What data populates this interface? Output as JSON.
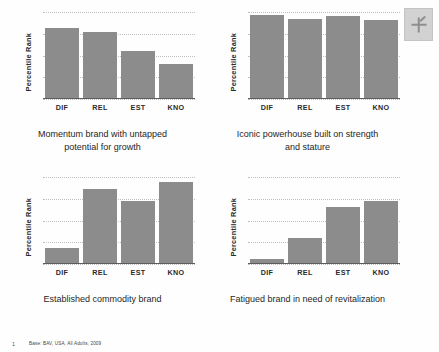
{
  "slide": {
    "corner_graphic_name": "placeholder-image-icon",
    "footnote_marker": "1",
    "footnote_text": "Base: BAV, USA, All Adults, 2009"
  },
  "axis": {
    "y_title": "Percentile Rank",
    "categories": [
      "DIF",
      "REL",
      "EST",
      "KNO"
    ]
  },
  "panels": [
    {
      "id": "momentum",
      "caption": "Momentum brand with untapped potential for growth",
      "values": [
        82,
        77,
        55,
        40
      ]
    },
    {
      "id": "iconic",
      "caption": "Iconic powerhouse  built on strength and stature",
      "values": [
        96,
        92,
        95,
        91
      ]
    },
    {
      "id": "commodity",
      "caption": "Established commodity brand",
      "values": [
        18,
        86,
        72,
        94
      ]
    },
    {
      "id": "fatigued",
      "caption": "Fatigued brand in need of revitalization",
      "values": [
        6,
        30,
        66,
        72
      ]
    }
  ],
  "chart_data": [
    {
      "type": "bar",
      "title": "Momentum brand with untapped potential for growth",
      "categories": [
        "DIF",
        "REL",
        "EST",
        "KNO"
      ],
      "values": [
        82,
        77,
        55,
        40
      ],
      "xlabel": "",
      "ylabel": "Percentile Rank",
      "ylim": [
        0,
        100
      ],
      "grid": true,
      "legend": "none",
      "bar_color": "#8c8c8c"
    },
    {
      "type": "bar",
      "title": "Iconic powerhouse  built on strength and stature",
      "categories": [
        "DIF",
        "REL",
        "EST",
        "KNO"
      ],
      "values": [
        96,
        92,
        95,
        91
      ],
      "xlabel": "",
      "ylabel": "Percentile Rank",
      "ylim": [
        0,
        100
      ],
      "grid": true,
      "legend": "none",
      "bar_color": "#8c8c8c"
    },
    {
      "type": "bar",
      "title": "Established commodity brand",
      "categories": [
        "DIF",
        "REL",
        "EST",
        "KNO"
      ],
      "values": [
        18,
        86,
        72,
        94
      ],
      "xlabel": "",
      "ylabel": "Percentile Rank",
      "ylim": [
        0,
        100
      ],
      "grid": true,
      "legend": "none",
      "bar_color": "#8c8c8c"
    },
    {
      "type": "bar",
      "title": "Fatigued brand in need of revitalization",
      "categories": [
        "DIF",
        "REL",
        "EST",
        "KNO"
      ],
      "values": [
        6,
        30,
        66,
        72
      ],
      "xlabel": "",
      "ylabel": "Percentile Rank",
      "ylim": [
        0,
        100
      ],
      "grid": true,
      "legend": "none",
      "bar_color": "#8c8c8c"
    }
  ]
}
